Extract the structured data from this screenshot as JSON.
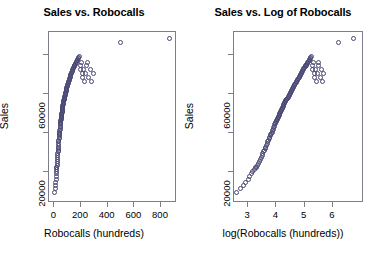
{
  "figure": {
    "background": "#ffffff",
    "point_color": "#474773",
    "frame_color": "#7d7d8c"
  },
  "chart_data": [
    {
      "type": "scatter",
      "title": "Sales vs. Robocalls",
      "xlabel": "Robocalls (hundreds)",
      "ylabel": "Sales",
      "xlim": [
        -40,
        920
      ],
      "ylim": [
        4000,
        92000
      ],
      "xticks": [
        0,
        200,
        400,
        600,
        800
      ],
      "xticklabels": [
        "0",
        "200",
        "400",
        "600",
        "800"
      ],
      "yticks": [
        20000,
        40000,
        60000,
        80000
      ],
      "yticklabels": [
        "20000",
        "",
        "60000",
        ""
      ],
      "grid": false,
      "legend": "none",
      "x": [
        10,
        14,
        16,
        18,
        20,
        21,
        22,
        24,
        25,
        26,
        27,
        28,
        29,
        30,
        31,
        32,
        33,
        34,
        35,
        36,
        37,
        38,
        39,
        40,
        41,
        42,
        43,
        44,
        45,
        46,
        47,
        48,
        49,
        50,
        51,
        52,
        53,
        54,
        55,
        56,
        57,
        58,
        59,
        60,
        61,
        62,
        63,
        64,
        65,
        66,
        67,
        68,
        69,
        70,
        71,
        72,
        73,
        74,
        75,
        76,
        78,
        80,
        82,
        84,
        85,
        86,
        88,
        90,
        92,
        94,
        95,
        96,
        98,
        100,
        102,
        104,
        105,
        108,
        110,
        112,
        115,
        118,
        120,
        122,
        125,
        128,
        130,
        132,
        135,
        138,
        140,
        142,
        145,
        148,
        150,
        155,
        158,
        160,
        165,
        168,
        170,
        175,
        178,
        180,
        185,
        190,
        195,
        200,
        205,
        210,
        215,
        220,
        225,
        230,
        240,
        250,
        255,
        265,
        275,
        285,
        300,
        500,
        870
      ],
      "y": [
        9000,
        11000,
        12500,
        14000,
        15500,
        17000,
        18500,
        19500,
        20500,
        21500,
        22000,
        23000,
        24000,
        25000,
        26000,
        27000,
        28000,
        29000,
        30000,
        30500,
        31500,
        32000,
        33000,
        34000,
        35000,
        35500,
        36500,
        37000,
        38000,
        38500,
        39500,
        40000,
        41000,
        41500,
        42500,
        43000,
        44000,
        44500,
        45000,
        45500,
        46000,
        46500,
        47000,
        47500,
        48000,
        48500,
        49000,
        49500,
        50000,
        50500,
        51000,
        51500,
        52000,
        52500,
        53000,
        53500,
        54000,
        54500,
        55000,
        55500,
        56000,
        56500,
        57000,
        57500,
        58000,
        58500,
        59000,
        59500,
        60000,
        60500,
        61000,
        61500,
        62000,
        62500,
        63000,
        63500,
        64000,
        64500,
        65000,
        65500,
        66000,
        66500,
        67000,
        67500,
        68000,
        68500,
        69000,
        69500,
        70000,
        70500,
        71000,
        71500,
        72000,
        72500,
        73000,
        73500,
        74000,
        74500,
        75000,
        75500,
        76000,
        76500,
        77000,
        77500,
        78000,
        78500,
        79000,
        72000,
        74000,
        76000,
        70000,
        68000,
        72000,
        66000,
        70000,
        74000,
        76000,
        68000,
        72000,
        66000,
        70000,
        86000,
        88000
      ]
    },
    {
      "type": "scatter",
      "title": "Sales vs. Log of Robocalls",
      "xlabel": "log(Robocalls (hundreds))",
      "ylabel": "Sales",
      "xlim": [
        2.5,
        7.1
      ],
      "ylim": [
        4000,
        92000
      ],
      "xticks": [
        3,
        4,
        5,
        6
      ],
      "xticklabels": [
        "3",
        "4",
        "5",
        "6"
      ],
      "yticks": [
        20000,
        40000,
        60000,
        80000
      ],
      "yticklabels": [
        "20000",
        "",
        "60000",
        ""
      ],
      "grid": false,
      "legend": "none",
      "x": [
        2.62,
        2.78,
        2.88,
        2.95,
        3.05,
        3.09,
        3.14,
        3.2,
        3.25,
        3.29,
        3.33,
        3.37,
        3.4,
        3.43,
        3.47,
        3.5,
        3.53,
        3.56,
        3.58,
        3.61,
        3.64,
        3.66,
        3.69,
        3.71,
        3.73,
        3.76,
        3.78,
        3.8,
        3.82,
        3.84,
        3.86,
        3.88,
        3.9,
        3.92,
        3.94,
        3.96,
        3.98,
        4.0,
        4.01,
        4.03,
        4.05,
        4.07,
        4.08,
        4.1,
        4.12,
        4.13,
        4.15,
        4.16,
        4.18,
        4.19,
        4.21,
        4.22,
        4.24,
        4.25,
        4.27,
        4.28,
        4.3,
        4.31,
        4.33,
        4.34,
        4.36,
        4.39,
        4.41,
        4.44,
        4.45,
        4.46,
        4.49,
        4.51,
        4.53,
        4.55,
        4.56,
        4.57,
        4.59,
        4.61,
        4.63,
        4.65,
        4.66,
        4.69,
        4.71,
        4.73,
        4.75,
        4.78,
        4.79,
        4.81,
        4.84,
        4.86,
        4.88,
        4.89,
        4.91,
        4.93,
        4.95,
        4.96,
        4.98,
        5.0,
        5.02,
        5.05,
        5.07,
        5.09,
        5.11,
        5.13,
        5.14,
        5.17,
        5.19,
        5.2,
        5.23,
        5.25,
        5.28,
        5.3,
        5.32,
        5.35,
        5.37,
        5.39,
        5.42,
        5.44,
        5.48,
        5.52,
        5.54,
        5.58,
        5.62,
        5.65,
        5.7,
        6.22,
        6.77
      ],
      "y": [
        9000,
        11000,
        12500,
        14000,
        15500,
        17000,
        18500,
        19500,
        20500,
        21500,
        22000,
        23000,
        24000,
        25000,
        26000,
        27000,
        28000,
        29000,
        30000,
        30500,
        31500,
        32000,
        33000,
        34000,
        35000,
        35500,
        36500,
        37000,
        38000,
        38500,
        39500,
        40000,
        41000,
        41500,
        42500,
        43000,
        44000,
        44500,
        45000,
        45500,
        46000,
        46500,
        47000,
        47500,
        48000,
        48500,
        49000,
        49500,
        50000,
        50500,
        51000,
        51500,
        52000,
        52500,
        53000,
        53500,
        54000,
        54500,
        55000,
        55500,
        56000,
        56500,
        57000,
        57500,
        58000,
        58500,
        59000,
        59500,
        60000,
        60500,
        61000,
        61500,
        62000,
        62500,
        63000,
        63500,
        64000,
        64500,
        65000,
        65500,
        66000,
        66500,
        67000,
        67500,
        68000,
        68500,
        69000,
        69500,
        70000,
        70500,
        71000,
        71500,
        72000,
        72500,
        73000,
        73500,
        74000,
        74500,
        75000,
        75500,
        76000,
        76500,
        77000,
        77500,
        78000,
        78500,
        79000,
        72000,
        74000,
        76000,
        70000,
        68000,
        72000,
        66000,
        70000,
        74000,
        76000,
        68000,
        72000,
        66000,
        70000,
        86000,
        88000
      ]
    }
  ]
}
